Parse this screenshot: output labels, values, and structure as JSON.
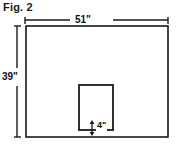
{
  "figure": {
    "caption": "Fig. 2",
    "background_color": "#ffffff",
    "line_color": "#1a1a1a",
    "shape_fill": "#ffffff"
  },
  "dimensions": {
    "width_label": "51\"",
    "height_label": "39\"",
    "inner_label": "4\""
  },
  "diagram_data": {
    "type": "technical-drawing",
    "outer_rectangle": {
      "name": "outer-rectangle",
      "width_in": 51,
      "height_in": 39,
      "unit": "inch"
    },
    "inner_rectangle": {
      "name": "inner-rectangle",
      "bottom_offset_in": 4,
      "unit": "inch"
    }
  }
}
